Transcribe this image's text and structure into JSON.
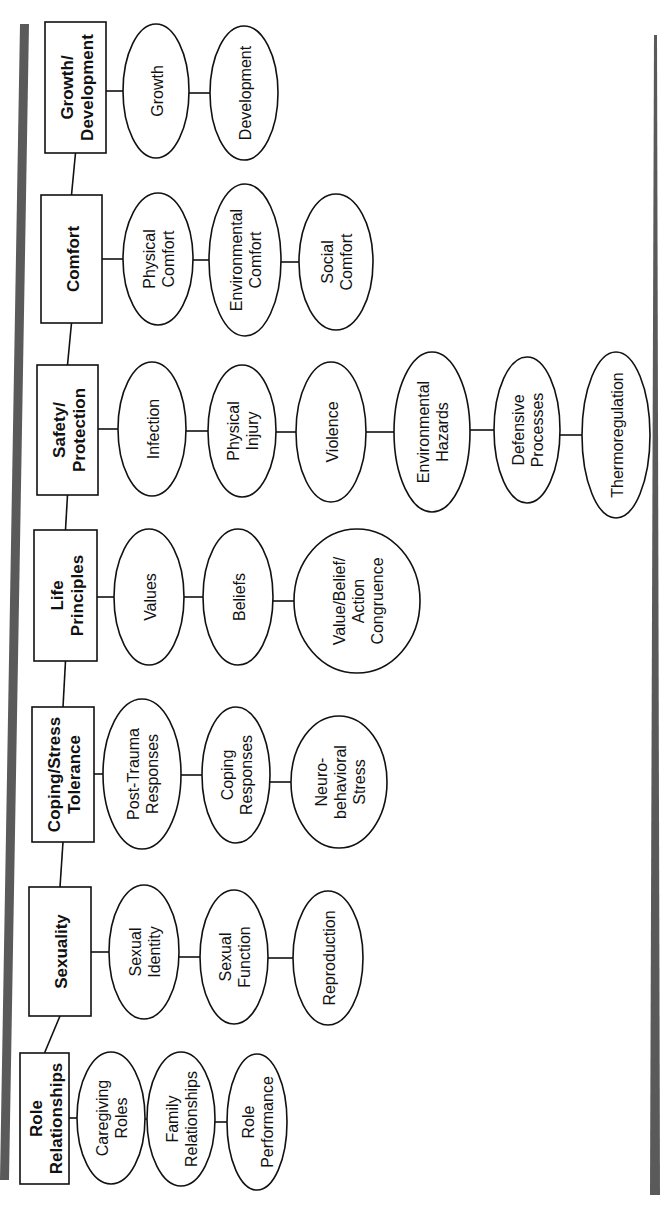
{
  "diagram": {
    "orientation": "rotated-90-ccw",
    "colors": {
      "line": "#111111",
      "bar": "#5a5a5a",
      "background": "#ffffff"
    },
    "domains": [
      {
        "label": [
          "Growth/",
          "Development"
        ],
        "box": {
          "x": 45,
          "y": 22,
          "w": 61,
          "h": 131
        },
        "classes": [
          {
            "label": [
              "Growth"
            ],
            "cx": 156,
            "cy": 91,
            "rx": 33,
            "ry": 67
          },
          {
            "label": [
              "Development"
            ],
            "cx": 244,
            "cy": 93,
            "rx": 34,
            "ry": 67
          }
        ]
      },
      {
        "label": [
          "Comfort"
        ],
        "box": {
          "x": 41,
          "y": 195,
          "w": 61,
          "h": 128
        },
        "classes": [
          {
            "label": [
              "Physical",
              "Comfort"
            ],
            "cx": 158,
            "cy": 259,
            "rx": 35,
            "ry": 66
          },
          {
            "label": [
              "Environmental",
              "Comfort"
            ],
            "cx": 245,
            "cy": 260,
            "rx": 36,
            "ry": 76
          },
          {
            "label": [
              "Social",
              "Comfort"
            ],
            "cx": 336,
            "cy": 262,
            "rx": 37,
            "ry": 68
          }
        ]
      },
      {
        "label": [
          "Safety/",
          "Protection"
        ],
        "box": {
          "x": 37,
          "y": 365,
          "w": 61,
          "h": 130
        },
        "classes": [
          {
            "label": [
              "Infection"
            ],
            "cx": 152,
            "cy": 429,
            "rx": 34,
            "ry": 67
          },
          {
            "label": [
              "Physical",
              "Injury"
            ],
            "cx": 242,
            "cy": 431,
            "rx": 34,
            "ry": 66
          },
          {
            "label": [
              "Violence"
            ],
            "cx": 331,
            "cy": 432,
            "rx": 35,
            "ry": 70
          },
          {
            "label": [
              "Environmental",
              "Hazards"
            ],
            "cx": 432,
            "cy": 432,
            "rx": 38,
            "ry": 80
          },
          {
            "label": [
              "Defensive",
              "Processes"
            ],
            "cx": 527,
            "cy": 430,
            "rx": 33,
            "ry": 73
          },
          {
            "label": [
              "Thermoregulation"
            ],
            "cx": 616,
            "cy": 435,
            "rx": 34,
            "ry": 83
          }
        ]
      },
      {
        "label": [
          "Life",
          "Principles"
        ],
        "box": {
          "x": 34,
          "y": 530,
          "w": 63,
          "h": 131
        },
        "classes": [
          {
            "label": [
              "Values"
            ],
            "cx": 149,
            "cy": 597,
            "rx": 35,
            "ry": 68
          },
          {
            "label": [
              "Beliefs"
            ],
            "cx": 238,
            "cy": 597,
            "rx": 35,
            "ry": 68
          },
          {
            "label": [
              "Value/Belief/",
              "Action",
              "Congruence"
            ],
            "cx": 357,
            "cy": 601,
            "rx": 63,
            "ry": 72
          }
        ]
      },
      {
        "label": [
          "Coping/Stress",
          "Tolerance"
        ],
        "box": {
          "x": 32,
          "y": 707,
          "w": 62,
          "h": 135
        },
        "classes": [
          {
            "label": [
              "Post-Trauma",
              "Responses"
            ],
            "cx": 142,
            "cy": 774,
            "rx": 39,
            "ry": 75
          },
          {
            "label": [
              "Coping",
              "Responses"
            ],
            "cx": 236,
            "cy": 775,
            "rx": 34,
            "ry": 68
          },
          {
            "label": [
              "Neuro-",
              "behavioral",
              "Stress"
            ],
            "cx": 339,
            "cy": 782,
            "rx": 48,
            "ry": 66
          }
        ]
      },
      {
        "label": [
          "Sexuality"
        ],
        "box": {
          "x": 29,
          "y": 887,
          "w": 62,
          "h": 129
        },
        "classes": [
          {
            "label": [
              "Sexual",
              "Identity"
            ],
            "cx": 144,
            "cy": 952,
            "rx": 35,
            "ry": 67
          },
          {
            "label": [
              "Sexual",
              "Function"
            ],
            "cx": 234,
            "cy": 957,
            "rx": 34,
            "ry": 67
          },
          {
            "label": [
              "Reproduction"
            ],
            "cx": 328,
            "cy": 958,
            "rx": 35,
            "ry": 67
          }
        ]
      },
      {
        "label": [
          "Role",
          "Relationships"
        ],
        "box": {
          "x": 20,
          "y": 1053,
          "w": 49,
          "h": 131
        },
        "classes": [
          {
            "label": [
              "Caregiving",
              "Roles"
            ],
            "cx": 111,
            "cy": 1118,
            "rx": 34,
            "ry": 66
          },
          {
            "label": [
              "Family",
              "Relationships"
            ],
            "cx": 181,
            "cy": 1119,
            "rx": 34,
            "ry": 67
          },
          {
            "label": [
              "Role",
              "Performance"
            ],
            "cx": 257,
            "cy": 1122,
            "rx": 30,
            "ry": 68
          }
        ]
      }
    ],
    "spine": {
      "x": 72,
      "top": 153,
      "bottom": 1053
    },
    "bars": [
      {
        "x1": 20,
        "y1": 24,
        "x2": 29,
        "y2": 24,
        "x3": 9,
        "y3": 1180,
        "x4": 0,
        "y4": 1180
      },
      {
        "x1": 654,
        "y1": 35,
        "x2": 657,
        "y2": 35,
        "x3": 660,
        "y3": 1195,
        "x4": 650,
        "y4": 1195
      }
    ]
  }
}
